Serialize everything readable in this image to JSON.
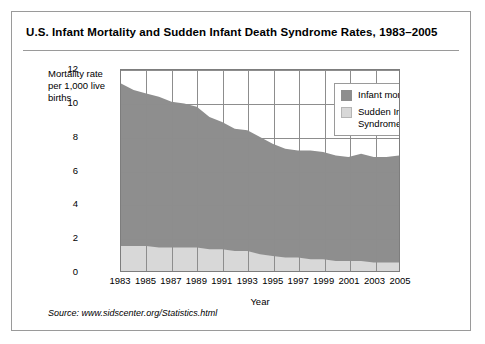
{
  "title": "U.S. Infant Mortality and Sudden Infant Death Syndrome Rates, 1983–2005",
  "y_axis_caption": "Mortality rate per 1,000 live births",
  "source": "Source: www.sidscenter.org/Statistics.html",
  "legend": {
    "items": [
      {
        "label": "Infant mortality rate",
        "color": "#8e8e8e"
      },
      {
        "label": "Sudden Infant Death Syndrome rate",
        "color": "#d8d8d8"
      }
    ]
  },
  "chart_data": {
    "type": "area",
    "title": "U.S. Infant Mortality and Sudden Infant Death Syndrome Rates, 1983–2005",
    "xlabel": "Year",
    "ylabel": "Mortality rate per 1,000 live births",
    "xlim": [
      1983,
      2005
    ],
    "ylim": [
      0,
      12
    ],
    "grid": true,
    "legend_position": "top-right",
    "x": [
      1983,
      1984,
      1985,
      1986,
      1987,
      1988,
      1989,
      1990,
      1991,
      1992,
      1993,
      1994,
      1995,
      1996,
      1997,
      1998,
      1999,
      2000,
      2001,
      2002,
      2003,
      2004,
      2005
    ],
    "xticks": [
      "1983",
      "1985",
      "1987",
      "1989",
      "1991",
      "1993",
      "1995",
      "1997",
      "1999",
      "2001",
      "2003",
      "2005"
    ],
    "yticks": [
      "0",
      "2",
      "4",
      "6",
      "8",
      "10",
      "12"
    ],
    "series": [
      {
        "name": "Infant mortality rate",
        "color": "#8e8e8e",
        "values": [
          11.2,
          10.8,
          10.6,
          10.4,
          10.1,
          10.0,
          9.8,
          9.2,
          8.9,
          8.5,
          8.4,
          8.0,
          7.6,
          7.3,
          7.2,
          7.2,
          7.1,
          6.9,
          6.8,
          7.0,
          6.8,
          6.8,
          6.9
        ]
      },
      {
        "name": "Sudden Infant Death Syndrome rate",
        "color": "#d8d8d8",
        "values": [
          1.5,
          1.5,
          1.5,
          1.4,
          1.4,
          1.4,
          1.4,
          1.3,
          1.3,
          1.2,
          1.2,
          1.0,
          0.9,
          0.8,
          0.8,
          0.7,
          0.7,
          0.6,
          0.6,
          0.6,
          0.5,
          0.5,
          0.5
        ]
      }
    ]
  }
}
